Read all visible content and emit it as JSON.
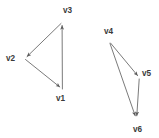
{
  "diagram": {
    "background_color": "#ffffff",
    "edge_color": "#6b6b6b",
    "label_color": "#3a3a3a",
    "width": 159,
    "height": 138,
    "components": [
      {
        "name": "left-triangle",
        "vertices": [
          {
            "id": "v1",
            "label": "v1",
            "x": 62,
            "y": 90,
            "label_x": 56,
            "label_y": 101
          },
          {
            "id": "v2",
            "label": "v2",
            "x": 24,
            "y": 58,
            "label_x": 6,
            "label_y": 61
          },
          {
            "id": "v3",
            "label": "v3",
            "x": 62,
            "y": 22,
            "label_x": 63,
            "label_y": 13
          }
        ],
        "edges": [
          {
            "from": "v1",
            "to": "v3",
            "arrow_at": "v3"
          },
          {
            "from": "v3",
            "to": "v2",
            "arrow_at": "v2"
          },
          {
            "from": "v2",
            "to": "v1",
            "arrow_at": "v1"
          }
        ]
      },
      {
        "name": "right-triangle",
        "vertices": [
          {
            "id": "v4",
            "label": "v4",
            "x": 110,
            "y": 41,
            "label_x": 104,
            "label_y": 34
          },
          {
            "id": "v5",
            "label": "v5",
            "x": 139,
            "y": 78,
            "label_x": 142,
            "label_y": 76
          },
          {
            "id": "v6",
            "label": "v6",
            "x": 136,
            "y": 119,
            "label_x": 133,
            "label_y": 132
          }
        ],
        "edges": [
          {
            "from": "v4",
            "to": "v5",
            "arrow_at": "v5"
          },
          {
            "from": "v4",
            "to": "v6",
            "arrow_at": "v6"
          },
          {
            "from": "v5",
            "to": "v6",
            "arrow_at": "v6"
          }
        ]
      }
    ]
  }
}
